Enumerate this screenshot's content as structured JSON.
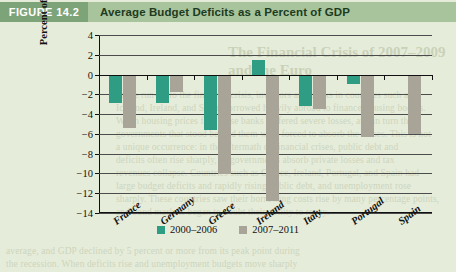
{
  "figure": {
    "tag": "FIGURE 14.2",
    "title": "Average Budget Deficits as a Percent of GDP"
  },
  "page_bleed": {
    "heading_line1": "The Financial Crisis of 2007–2009",
    "heading_line2": "and the Euro",
    "lines": [
      "In the run-up to the financial crisis, investors and banks in countries such as",
      "Iceland, Ireland, and Spain borrowed heavily abroad to finance housing booms.",
      "When housing prices fell, these banks suffered severe losses, and in turn the",
      "governments that stood behind them were forced to absorb the losses. This is not",
      "a unique occurrence: in the aftermath of financial crises, public debt and",
      "deficits often rise sharply, as governments absorb private losses and tax",
      "revenues collapse. Countries such as Greece, Ireland, Portugal, and Spain had",
      "large budget deficits and rapidly rising public debt, and unemployment rose",
      "sharply. These countries saw their borrowing costs rise by many percentage points,",
      "and bond markets began to doubt their ability to repay.",
      "average, and GDP declined by 5 percent or more from its peak point during",
      "the recession. When deficits rise and unemployment budgets move sharply"
    ]
  },
  "chart_data": {
    "type": "bar",
    "title": "Average Budget Deficits as a Percent of GDP",
    "xlabel": "",
    "ylabel": "Percent of GDP",
    "categories": [
      "France",
      "Germany",
      "Greece",
      "Ireland",
      "Italy",
      "Portugal",
      "Spain"
    ],
    "series": [
      {
        "name": "2000–2006",
        "color": "#2e9d83",
        "values": [
          -2.9,
          -2.9,
          -5.6,
          1.5,
          -3.2,
          -1.0,
          0.0
        ]
      },
      {
        "name": "2007–2011",
        "color": "#a8a498",
        "values": [
          -5.4,
          -1.8,
          -10.1,
          -12.8,
          -3.5,
          -6.3,
          -6.0
        ]
      }
    ],
    "ylim": [
      -14,
      4
    ],
    "yticks": [
      4,
      2,
      0,
      -2,
      -4,
      -6,
      -8,
      -10,
      -12,
      -14
    ],
    "ytick_labels": [
      "4",
      "2",
      "0",
      "−2",
      "−4",
      "−6",
      "−8",
      "−10",
      "−12",
      "−14"
    ],
    "grid": true,
    "legend_position": "bottom"
  },
  "colors": {
    "series_2000_2006": "#2e9d83",
    "series_2007_2011": "#a8a498",
    "header_band": "#a8c49c",
    "header_tag": "#7da378",
    "page_background": "#e6ecda"
  }
}
